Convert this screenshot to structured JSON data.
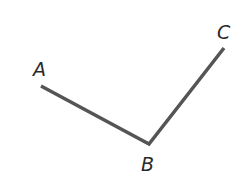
{
  "diagram": {
    "type": "angle",
    "points": {
      "A": {
        "label": "A",
        "x": 41,
        "y": 86,
        "label_x": 33,
        "label_y": 76
      },
      "B": {
        "label": "B",
        "x": 149,
        "y": 144,
        "label_x": 141,
        "label_y": 171
      },
      "C": {
        "label": "C",
        "x": 224,
        "y": 48,
        "label_x": 217,
        "label_y": 39
      }
    },
    "segments": [
      [
        "A",
        "B"
      ],
      [
        "B",
        "C"
      ]
    ],
    "stroke_color": "#555555",
    "stroke_width": 3.5
  }
}
